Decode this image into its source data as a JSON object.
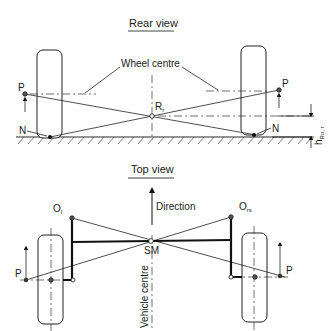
{
  "rear_view": {
    "title": "Rear view",
    "wheel_centre_label": "Wheel centre",
    "roll_centre_label": "R",
    "roll_centre_sub": "r",
    "left_force_point": "P",
    "right_force_point": "P",
    "left_contact_point": "N",
    "right_contact_point": "N",
    "height_label": "h",
    "height_sub": "Ro, r"
  },
  "top_view": {
    "title": "Top view",
    "direction_label": "Direction",
    "vehicle_centre_label": "Vehicle centre",
    "left_pivot_label": "O",
    "left_pivot_sub": "l",
    "right_pivot_label": "O",
    "right_pivot_sub": "rs",
    "centre_point_label": "SM",
    "left_force_point": "P",
    "right_force_point": "P"
  }
}
